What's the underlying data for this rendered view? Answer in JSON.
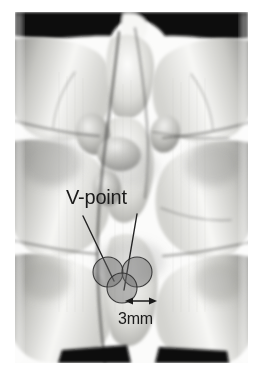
{
  "figure": {
    "kind": "3d-ct-volume-rendering",
    "view": "posterior",
    "background_color": "#ffffff"
  },
  "annotations": {
    "vpoint": {
      "label": "V-point",
      "color": "#1a1a1a",
      "font_size_px": 20,
      "x": 66,
      "y": 186
    },
    "scale": {
      "label": "3mm",
      "color": "#1a1a1a",
      "font_size_px": 16,
      "x": 118,
      "y": 310
    },
    "leader_lines": [
      {
        "name": "leader-line-left",
        "x1": 83,
        "y1": 216,
        "x2": 114,
        "y2": 281,
        "color": "#232323",
        "width": 1.4
      },
      {
        "name": "leader-line-right",
        "x1": 137,
        "y1": 214,
        "x2": 124,
        "y2": 290,
        "color": "#232323",
        "width": 1.4
      }
    ],
    "markers": [
      {
        "name": "entry-circle-upper-left",
        "cx": 108,
        "cy": 272,
        "r": 15,
        "fill": "#6b6b6b",
        "fill_opacity": 0.45,
        "stroke": "#2e2e2e"
      },
      {
        "name": "entry-circle-upper-right",
        "cx": 137,
        "cy": 272,
        "r": 15,
        "fill": "#6b6b6b",
        "fill_opacity": 0.45,
        "stroke": "#2e2e2e"
      },
      {
        "name": "entry-circle-lower-center",
        "cx": 122,
        "cy": 288,
        "r": 15,
        "fill": "#6b6b6b",
        "fill_opacity": 0.45,
        "stroke": "#2e2e2e"
      }
    ],
    "dimension_arrow": {
      "name": "scale-arrow-3mm",
      "x1": 126,
      "x2": 156,
      "y": 301,
      "color": "#1a1a1a",
      "double_headed": true
    }
  },
  "colors": {
    "bone_light": "#f2f2f0",
    "bone_mid": "#c9c9c6",
    "bone_shade": "#9a9a97",
    "bone_dark": "#6e6e6c",
    "cleft_dark": "#4a4a48",
    "void_black": "#0a0a0a",
    "annotation": "#1a1a1a",
    "marker_fill": "#6b6b6b"
  }
}
